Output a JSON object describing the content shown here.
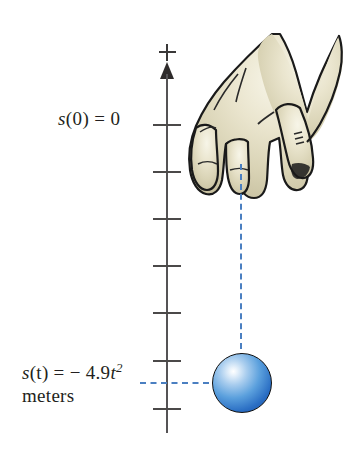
{
  "figure": {
    "background_color": "#ffffff"
  },
  "axis": {
    "name": "vertical position axis",
    "plus_sign": "+",
    "arrow_direction": "up",
    "tick_count": 7,
    "tick_positions_px": [
      124,
      171,
      218,
      265,
      312,
      360,
      408
    ],
    "line_color": "#555355"
  },
  "labels": {
    "top": {
      "text": "s(0) = 0",
      "variable": "s",
      "argument": "(0)",
      "equals": "=",
      "value": "0"
    },
    "bottom": {
      "text": "s(t) = - 4.9t^2 meters",
      "variable": "s",
      "argument": "(t)",
      "equals": "=",
      "minus": "−",
      "coefficient": "4.9",
      "time_variable": "t",
      "exponent": "2",
      "units": "meters"
    }
  },
  "guides": {
    "vertical_dashed": {
      "name": "drop-path-line",
      "color": "#4a7fc1",
      "from": "fingertip",
      "to": "ball-top"
    },
    "horizontal_dashed": {
      "name": "ball-height-line",
      "color": "#4a7fc1",
      "from": "axis",
      "to": "ball-center"
    }
  },
  "ball": {
    "name": "falling-ball",
    "color": "#2b6fc4",
    "highlight_color": "#ffffff",
    "outline_color": "#101010",
    "diameter_px": 60
  },
  "hand": {
    "name": "hand-releasing-ball",
    "skin_color": "#ded9bf",
    "outline_color": "#1a1a1a",
    "description": "hand with index finger pointing down releasing the ball"
  }
}
